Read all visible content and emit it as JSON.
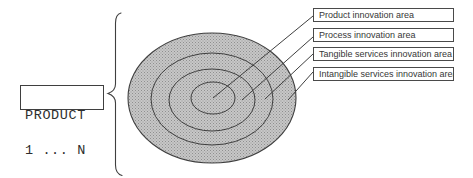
{
  "product_box": {
    "line1": "PRODUCT",
    "line2": "1 ... N"
  },
  "labels": [
    {
      "text": "Product innovation area"
    },
    {
      "text": "Process innovation area"
    },
    {
      "text": "Tangible services innovation area"
    },
    {
      "text": "Intangible services innovation area"
    }
  ],
  "colors": {
    "background": "#ffffff",
    "outline": "#3f3f3f",
    "ellipse_fill_base": "#c7c7c7",
    "ellipse_fill_dot": "#8f8f8f"
  }
}
